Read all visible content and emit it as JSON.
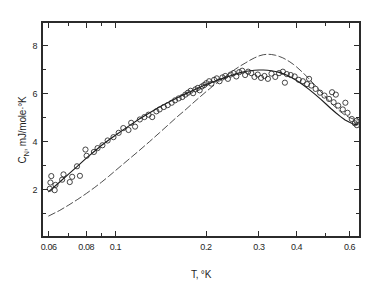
{
  "figure": {
    "background_color": "#ffffff",
    "ink_color": "#1c1c1c"
  },
  "chart_data": {
    "type": "scatter",
    "title": "",
    "subtitle": "",
    "xlabel": "T, °K",
    "ylabel": "Cₙ, mJ/mole·°K",
    "ylabel_symbol": "C",
    "ylabel_subscript": "N",
    "ylabel_units": ", mJ/mole·°K",
    "xscale": "log",
    "yscale": "linear",
    "xlim": [
      0.057,
      0.65
    ],
    "ylim": [
      0.0,
      9.0
    ],
    "grid": false,
    "legend": "none",
    "frame": "box",
    "tick_direction": "in",
    "x_major_ticks": [
      0.06,
      0.08,
      0.1,
      0.2,
      0.3,
      0.4,
      0.6
    ],
    "x_major_labels": [
      "0.06",
      "0.08",
      "0.1",
      "0.2",
      "0.3",
      "0.4",
      "0.6"
    ],
    "x_minor_ticks": [
      0.07,
      0.09,
      0.5
    ],
    "y_major_ticks": [
      2,
      4,
      6,
      8
    ],
    "y_major_labels": [
      "2",
      "4",
      "6",
      "8"
    ],
    "y_minor_ticks": [
      1,
      3,
      5,
      7
    ],
    "marker": {
      "shape": "open-circle",
      "radius_px": 2.6,
      "edge_color": "#262626",
      "fill": "none"
    },
    "series": [
      {
        "name": "measured-points",
        "type": "scatter",
        "points": [
          [
            0.0605,
            2.02
          ],
          [
            0.0608,
            2.28
          ],
          [
            0.0612,
            2.55
          ],
          [
            0.0628,
            1.96
          ],
          [
            0.0632,
            2.18
          ],
          [
            0.0665,
            2.4
          ],
          [
            0.0672,
            2.62
          ],
          [
            0.0705,
            2.3
          ],
          [
            0.0718,
            2.52
          ],
          [
            0.0745,
            2.96
          ],
          [
            0.0762,
            2.56
          ],
          [
            0.0795,
            3.66
          ],
          [
            0.0802,
            3.4
          ],
          [
            0.0848,
            3.56
          ],
          [
            0.0872,
            3.72
          ],
          [
            0.0905,
            3.84
          ],
          [
            0.0942,
            4.04
          ],
          [
            0.0985,
            4.18
          ],
          [
            0.1025,
            4.36
          ],
          [
            0.1062,
            4.56
          ],
          [
            0.1105,
            4.48
          ],
          [
            0.1128,
            4.78
          ],
          [
            0.1162,
            4.62
          ],
          [
            0.1205,
            4.92
          ],
          [
            0.1248,
            5.02
          ],
          [
            0.1288,
            5.12
          ],
          [
            0.1325,
            5.02
          ],
          [
            0.1368,
            5.26
          ],
          [
            0.1402,
            5.34
          ],
          [
            0.1448,
            5.44
          ],
          [
            0.1492,
            5.52
          ],
          [
            0.1538,
            5.62
          ],
          [
            0.1578,
            5.72
          ],
          [
            0.1622,
            5.8
          ],
          [
            0.1668,
            5.86
          ],
          [
            0.1708,
            5.96
          ],
          [
            0.1742,
            6.04
          ],
          [
            0.1778,
            6.12
          ],
          [
            0.1812,
            6.02
          ],
          [
            0.1845,
            6.18
          ],
          [
            0.1878,
            6.24
          ],
          [
            0.1905,
            6.14
          ],
          [
            0.1938,
            6.3
          ],
          [
            0.1972,
            6.36
          ],
          [
            0.2005,
            6.44
          ],
          [
            0.2048,
            6.52
          ],
          [
            0.2085,
            6.42
          ],
          [
            0.2128,
            6.58
          ],
          [
            0.2172,
            6.64
          ],
          [
            0.2218,
            6.52
          ],
          [
            0.2268,
            6.68
          ],
          [
            0.2318,
            6.74
          ],
          [
            0.2365,
            6.62
          ],
          [
            0.2415,
            6.8
          ],
          [
            0.2468,
            6.86
          ],
          [
            0.2522,
            6.72
          ],
          [
            0.2578,
            6.9
          ],
          [
            0.2638,
            6.96
          ],
          [
            0.2698,
            6.78
          ],
          [
            0.2762,
            6.92
          ],
          [
            0.2828,
            6.86
          ],
          [
            0.2898,
            6.7
          ],
          [
            0.2972,
            6.8
          ],
          [
            0.3048,
            6.66
          ],
          [
            0.3128,
            6.74
          ],
          [
            0.3212,
            6.62
          ],
          [
            0.3302,
            6.84
          ],
          [
            0.3398,
            6.7
          ],
          [
            0.3498,
            6.86
          ],
          [
            0.3602,
            6.92
          ],
          [
            0.3658,
            6.46
          ],
          [
            0.3712,
            6.82
          ],
          [
            0.3825,
            6.78
          ],
          [
            0.3942,
            6.72
          ],
          [
            0.4068,
            6.58
          ],
          [
            0.4198,
            6.52
          ],
          [
            0.4335,
            6.4
          ],
          [
            0.4402,
            6.62
          ],
          [
            0.4478,
            6.34
          ],
          [
            0.4628,
            6.2
          ],
          [
            0.4788,
            6.04
          ],
          [
            0.4952,
            5.92
          ],
          [
            0.5128,
            5.78
          ],
          [
            0.5248,
            6.06
          ],
          [
            0.5312,
            5.64
          ],
          [
            0.5402,
            5.96
          ],
          [
            0.5498,
            5.5
          ],
          [
            0.5698,
            5.34
          ],
          [
            0.5812,
            5.62
          ],
          [
            0.5908,
            5.2
          ],
          [
            0.6102,
            4.94
          ],
          [
            0.6248,
            4.76
          ],
          [
            0.6328,
            4.86
          ],
          [
            0.6348,
            4.68
          ]
        ]
      },
      {
        "name": "solid-fit-curve",
        "type": "line",
        "style": "solid",
        "points": [
          [
            0.06,
            1.9
          ],
          [
            0.065,
            2.28
          ],
          [
            0.07,
            2.64
          ],
          [
            0.075,
            2.98
          ],
          [
            0.08,
            3.3
          ],
          [
            0.085,
            3.58
          ],
          [
            0.09,
            3.84
          ],
          [
            0.095,
            4.06
          ],
          [
            0.1,
            4.26
          ],
          [
            0.11,
            4.62
          ],
          [
            0.12,
            4.94
          ],
          [
            0.13,
            5.2
          ],
          [
            0.14,
            5.44
          ],
          [
            0.15,
            5.64
          ],
          [
            0.16,
            5.82
          ],
          [
            0.17,
            5.98
          ],
          [
            0.18,
            6.12
          ],
          [
            0.19,
            6.26
          ],
          [
            0.2,
            6.38
          ],
          [
            0.21,
            6.48
          ],
          [
            0.22,
            6.58
          ],
          [
            0.23,
            6.66
          ],
          [
            0.24,
            6.74
          ],
          [
            0.25,
            6.82
          ],
          [
            0.26,
            6.88
          ],
          [
            0.27,
            6.93
          ],
          [
            0.28,
            6.96
          ],
          [
            0.29,
            6.98
          ],
          [
            0.3,
            6.99
          ],
          [
            0.31,
            6.99
          ],
          [
            0.32,
            6.98
          ],
          [
            0.33,
            6.96
          ],
          [
            0.34,
            6.93
          ],
          [
            0.35,
            6.89
          ],
          [
            0.36,
            6.84
          ],
          [
            0.37,
            6.78
          ],
          [
            0.38,
            6.71
          ],
          [
            0.39,
            6.63
          ],
          [
            0.4,
            6.55
          ],
          [
            0.42,
            6.37
          ],
          [
            0.44,
            6.18
          ],
          [
            0.46,
            5.98
          ],
          [
            0.48,
            5.78
          ],
          [
            0.5,
            5.58
          ],
          [
            0.52,
            5.38
          ],
          [
            0.54,
            5.2
          ],
          [
            0.56,
            5.04
          ],
          [
            0.58,
            4.9
          ],
          [
            0.6,
            4.8
          ],
          [
            0.62,
            4.72
          ],
          [
            0.64,
            4.7
          ]
        ]
      },
      {
        "name": "dashed-theory-curve",
        "type": "line",
        "style": "dashed",
        "points": [
          [
            0.06,
            0.88
          ],
          [
            0.065,
            1.1
          ],
          [
            0.07,
            1.34
          ],
          [
            0.075,
            1.58
          ],
          [
            0.08,
            1.82
          ],
          [
            0.085,
            2.06
          ],
          [
            0.09,
            2.3
          ],
          [
            0.095,
            2.54
          ],
          [
            0.1,
            2.78
          ],
          [
            0.11,
            3.22
          ],
          [
            0.12,
            3.62
          ],
          [
            0.13,
            4.0
          ],
          [
            0.14,
            4.36
          ],
          [
            0.15,
            4.7
          ],
          [
            0.16,
            5.02
          ],
          [
            0.17,
            5.3
          ],
          [
            0.18,
            5.58
          ],
          [
            0.19,
            5.84
          ],
          [
            0.2,
            6.08
          ],
          [
            0.21,
            6.3
          ],
          [
            0.22,
            6.5
          ],
          [
            0.23,
            6.68
          ],
          [
            0.24,
            6.86
          ],
          [
            0.25,
            7.02
          ],
          [
            0.26,
            7.16
          ],
          [
            0.27,
            7.28
          ],
          [
            0.28,
            7.4
          ],
          [
            0.29,
            7.5
          ],
          [
            0.3,
            7.58
          ],
          [
            0.31,
            7.63
          ],
          [
            0.32,
            7.65
          ],
          [
            0.33,
            7.64
          ],
          [
            0.34,
            7.61
          ],
          [
            0.35,
            7.56
          ],
          [
            0.36,
            7.5
          ],
          [
            0.37,
            7.42
          ],
          [
            0.38,
            7.33
          ],
          [
            0.39,
            7.23
          ],
          [
            0.4,
            7.12
          ],
          [
            0.42,
            6.88
          ],
          [
            0.44,
            6.62
          ],
          [
            0.46,
            6.36
          ],
          [
            0.48,
            6.1
          ],
          [
            0.5,
            5.86
          ],
          [
            0.52,
            5.62
          ],
          [
            0.54,
            5.42
          ],
          [
            0.56,
            5.24
          ],
          [
            0.58,
            5.1
          ],
          [
            0.6,
            5.0
          ],
          [
            0.62,
            4.93
          ],
          [
            0.64,
            4.9
          ]
        ]
      }
    ]
  }
}
